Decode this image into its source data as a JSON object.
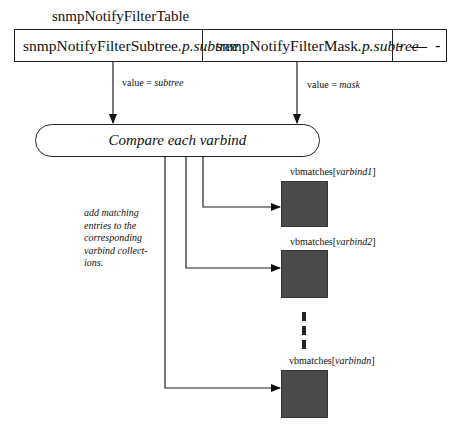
{
  "title": "snmpNotifyFilterTable",
  "table": {
    "columns": [
      {
        "name": "snmpNotifyFilterSubtree",
        "suffix": ".p.subtree"
      },
      {
        "name": "snmpNotifyFilterMask",
        "suffix": ".p.subtree"
      },
      {
        "name": "- — -"
      }
    ]
  },
  "edges": {
    "subtree_label": {
      "prefix": "value = ",
      "value": "subtree"
    },
    "mask_label": {
      "prefix": "value = ",
      "value": "mask"
    }
  },
  "process": {
    "label": "Compare each varbind"
  },
  "note": "add matching entries to the corresponding varbind collect-ions.",
  "outputs": [
    {
      "prefix": "vbmatches[",
      "var": "varbind1",
      "suffix": "]"
    },
    {
      "prefix": "vbmatches[",
      "var": "varbind2",
      "suffix": "]"
    },
    {
      "prefix": "vbmatches[",
      "var": "varbindn",
      "suffix": "]"
    }
  ],
  "colors": {
    "line": "#222222",
    "box_fill": "#4a4a4a"
  }
}
